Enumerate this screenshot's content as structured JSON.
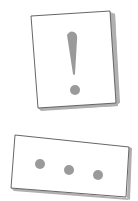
{
  "cards": [
    {
      "name": "alert-card",
      "icon": "exclamation-icon",
      "shadow_color": "#a8a8a8",
      "border_color": "#555555",
      "fill": "#ffffff",
      "glyph_color": "#9a9a9a"
    },
    {
      "name": "ellipsis-card",
      "icon": "ellipsis-icon",
      "dot_count": 3,
      "shadow_color": "#a8a8a8",
      "border_color": "#555555",
      "fill": "#ffffff",
      "glyph_color": "#9a9a9a"
    }
  ]
}
